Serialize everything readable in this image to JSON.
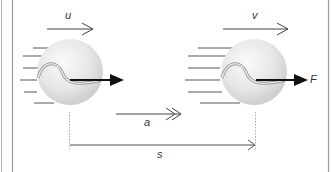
{
  "diagram": {
    "labels": {
      "initial_velocity": "u",
      "final_velocity": "v",
      "acceleration": "a",
      "displacement": "s",
      "force": "F"
    },
    "colors": {
      "frame": "#9a9a9a",
      "arrow": "#444444",
      "force_arrow": "#111111",
      "ball_light": "#f4f4f4",
      "ball_dark": "#cfcfcf",
      "seam": "#9a9a9a",
      "guide_dash": "#aaaaaa"
    }
  }
}
